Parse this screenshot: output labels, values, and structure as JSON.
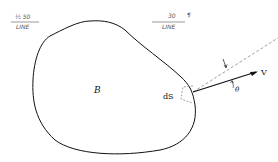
{
  "diagram": {
    "body_label": "B",
    "element_label": "dS",
    "vector_label": "V",
    "angle_label": "θ",
    "annotations": {
      "left_top": "½ 50",
      "left_bottom": "LINE",
      "right_top": "30",
      "right_mark": "¶",
      "right_bottom": "LINE"
    },
    "colors": {
      "stroke": "#111111",
      "dashed": "#777777",
      "annotation": "#555555"
    }
  }
}
